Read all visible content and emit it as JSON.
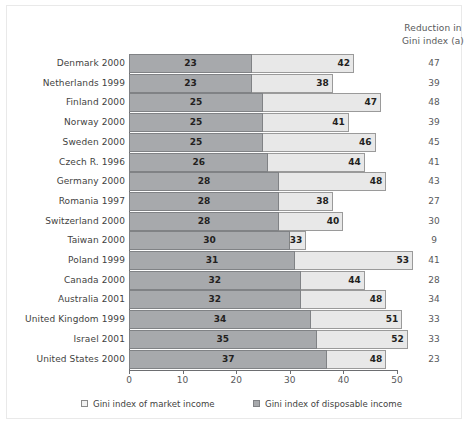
{
  "chart_data": {
    "type": "bar",
    "orientation": "horizontal",
    "title": "",
    "xlabel": "",
    "ylabel": "",
    "xlim": [
      0,
      50
    ],
    "xticks": [
      0,
      10,
      20,
      30,
      40,
      50
    ],
    "grid": false,
    "legend_position": "bottom",
    "categories": [
      "Denmark 2000",
      "Netherlands 1999",
      "Finland 2000",
      "Norway 2000",
      "Sweden 2000",
      "Czech R. 1996",
      "Germany 2000",
      "Romania 1997",
      "Switzerland 2000",
      "Taiwan 2000",
      "Poland 1999",
      "Canada 2000",
      "Australia 2001",
      "United Kingdom 1999",
      "Israel 2001",
      "United States 2000"
    ],
    "series": [
      {
        "name": "Gini index of market income",
        "values": [
          42,
          38,
          47,
          41,
          46,
          44,
          48,
          38,
          40,
          33,
          53,
          44,
          48,
          51,
          52,
          48
        ]
      },
      {
        "name": "Gini index of disposable income",
        "values": [
          23,
          23,
          25,
          25,
          25,
          26,
          28,
          28,
          28,
          30,
          31,
          32,
          32,
          34,
          35,
          37
        ]
      }
    ],
    "extra_column": {
      "header_line1": "Reduction in",
      "header_line2": "Gini index (a)",
      "values": [
        47,
        39,
        48,
        39,
        45,
        41,
        43,
        27,
        30,
        9,
        41,
        28,
        34,
        33,
        33,
        23
      ]
    },
    "colors": {
      "market_income": "#e8e8e8",
      "disposable_income": "#a7a9ac",
      "axis": "#6d6e71",
      "text": "#3f3f41"
    }
  },
  "legend": [
    {
      "label": "Gini index of market income",
      "swatch": "light"
    },
    {
      "label": "Gini index of disposable income",
      "swatch": "dark"
    }
  ]
}
